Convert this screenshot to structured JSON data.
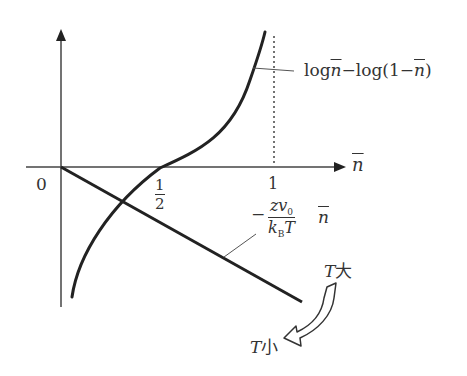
{
  "diagram": {
    "axes": {
      "origin_label": "0",
      "x_axis_label": "n",
      "x_ticks": [
        {
          "num": "1",
          "den": "2"
        },
        {
          "value": "1"
        }
      ]
    },
    "curves": {
      "log_curve_label": {
        "part1": "log",
        "var1": "n",
        "part2": "−log(1−",
        "var2": "n",
        "part3": ")"
      },
      "line_label": {
        "minus": "−",
        "numerator": "zv",
        "numerator_sub": "0",
        "denominator_k": "k",
        "denominator_sub": "B",
        "denominator_T": "T",
        "var": "n"
      }
    },
    "temperature_arrow": {
      "high_label_T": "T",
      "high_label_kanji": "大",
      "low_label_T": "T",
      "low_label_kanji": "小"
    },
    "colors": {
      "stroke": "#222222",
      "axis": "#333333",
      "text": "#333333"
    }
  }
}
